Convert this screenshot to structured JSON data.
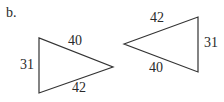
{
  "part_label": "b.",
  "triangles": [
    {
      "name": "triangle-left",
      "sides": {
        "top": "40",
        "left": "31",
        "bottom": "42"
      },
      "vertices": [
        [
          39,
          38
        ],
        [
          39,
          93
        ],
        [
          113,
          67
        ]
      ]
    },
    {
      "name": "triangle-right",
      "sides": {
        "top": "42",
        "right": "31",
        "bottom": "40"
      },
      "vertices": [
        [
          124,
          44
        ],
        [
          198,
          17
        ],
        [
          198,
          72
        ]
      ]
    }
  ],
  "colors": {
    "stroke": "#333333",
    "text": "#2a2a2a"
  }
}
